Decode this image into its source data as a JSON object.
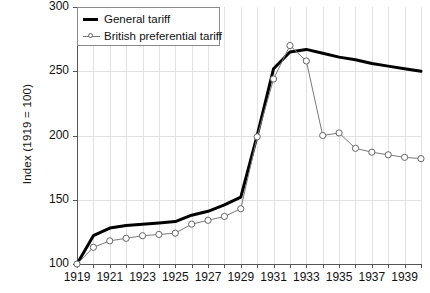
{
  "chart_data": {
    "type": "line",
    "title": "",
    "xlabel": "",
    "ylabel": "Index (1919 = 100)",
    "xlim": [
      1919,
      1940
    ],
    "ylim": [
      100,
      300
    ],
    "yticks": [
      100,
      150,
      200,
      250,
      300
    ],
    "xticks": [
      1919,
      1920,
      1921,
      1922,
      1923,
      1924,
      1925,
      1926,
      1927,
      1928,
      1929,
      1930,
      1931,
      1932,
      1933,
      1934,
      1935,
      1936,
      1937,
      1938,
      1939,
      1940
    ],
    "xtick_labels": [
      "1919",
      "",
      "1921",
      "",
      "1923",
      "",
      "1925",
      "",
      "1927",
      "",
      "1929",
      "",
      "1931",
      "",
      "1933",
      "",
      "1935",
      "",
      "1937",
      "",
      "1939",
      ""
    ],
    "grid": "vertical-and-horizontal",
    "legend_position": "top-left",
    "x": [
      1919,
      1920,
      1921,
      1922,
      1923,
      1924,
      1925,
      1926,
      1927,
      1928,
      1929,
      1930,
      1931,
      1932,
      1933,
      1934,
      1935,
      1936,
      1937,
      1938,
      1939,
      1940
    ],
    "series": [
      {
        "name": "General tariff",
        "color": "#000000",
        "marker": "none",
        "width": 3,
        "values": [
          100,
          122,
          128,
          130,
          131,
          132,
          133,
          138,
          141,
          146,
          152,
          200,
          252,
          265,
          267,
          264,
          261,
          259,
          256,
          254,
          252,
          250
        ]
      },
      {
        "name": "British preferential tariff",
        "color": "#7a7a7a",
        "marker": "circle",
        "width": 1,
        "values": [
          100,
          113,
          118,
          120,
          122,
          123,
          124,
          131,
          134,
          137,
          143,
          199,
          244,
          270,
          258,
          200,
          202,
          190,
          187,
          185,
          183,
          182
        ]
      }
    ]
  },
  "legend": {
    "items": [
      {
        "label": "General tariff"
      },
      {
        "label": "British preferential tariff"
      }
    ]
  },
  "axis": {
    "y_title": "Index (1919 = 100)"
  },
  "source_note": ""
}
